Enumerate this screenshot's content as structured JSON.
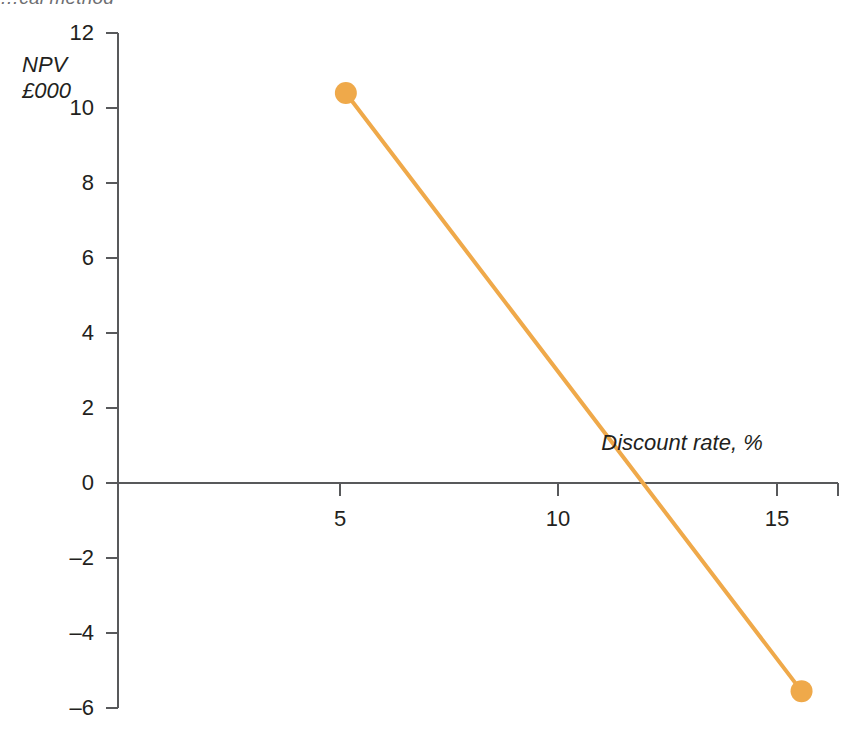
{
  "caption": {
    "fragment": "…cal method"
  },
  "chart_data": {
    "type": "line",
    "title": "",
    "xlabel": "Discount rate, %",
    "ylabel": "NPV\n£000",
    "ylabel_lines": [
      "NPV",
      "£000"
    ],
    "x": [
      5,
      15
    ],
    "values": [
      10.4,
      -5.55
    ],
    "series": [
      {
        "name": "NPV",
        "x": [
          5,
          15
        ],
        "values": [
          10.4,
          -5.55
        ],
        "color": "#EFA94A",
        "marker": "circle",
        "marker_color": "#EFA94A"
      }
    ],
    "xlim": [
      0,
      15.8
    ],
    "ylim": [
      -6,
      12
    ],
    "xticks": [
      5,
      10,
      15
    ],
    "xtick_labels": [
      "5",
      "10",
      "15"
    ],
    "yticks": [
      12,
      10,
      8,
      6,
      4,
      2,
      0,
      -2,
      -4,
      -6
    ],
    "ytick_labels": [
      "12",
      "10",
      "8",
      "6",
      "4",
      "2",
      "0",
      "–2",
      "–4",
      "–6"
    ],
    "grid": false,
    "legend": "none",
    "zero_line": 0,
    "zero_crossing_x": 11.4,
    "annotations": []
  },
  "colors": {
    "series": "#EFA94A",
    "axis": "#58595B",
    "text": "#231f20",
    "caption": "#6d6e71",
    "background": "#FFFFFF"
  }
}
